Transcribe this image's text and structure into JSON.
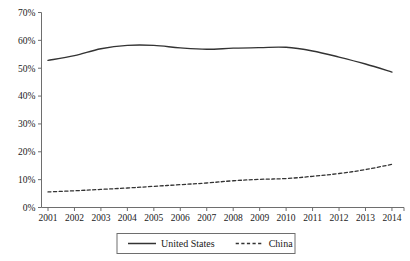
{
  "chart_data": {
    "type": "line",
    "title": "",
    "subtitle": "",
    "xlabel": "",
    "ylabel": "",
    "categories": [
      "2001",
      "2002",
      "2003",
      "2004",
      "2005",
      "2006",
      "2007",
      "2008",
      "2009",
      "2010",
      "2011",
      "2012",
      "2013",
      "2014"
    ],
    "x": [
      2001,
      2002,
      2003,
      2004,
      2005,
      2006,
      2007,
      2008,
      2009,
      2010,
      2011,
      2012,
      2013,
      2014
    ],
    "series": [
      {
        "name": "United States",
        "style": "solid",
        "color": "#333333",
        "values": [
          52.8,
          54.5,
          57.0,
          58.2,
          58.2,
          57.3,
          56.8,
          57.2,
          57.4,
          57.5,
          56.2,
          54.0,
          51.5,
          48.6
        ]
      },
      {
        "name": "China",
        "style": "dashed",
        "color": "#333333",
        "values": [
          5.6,
          6.0,
          6.5,
          7.0,
          7.6,
          8.2,
          8.8,
          9.6,
          10.1,
          10.4,
          11.2,
          12.2,
          13.6,
          15.5
        ]
      }
    ],
    "ylim": [
      0,
      70
    ],
    "yticks": [
      0,
      10,
      20,
      30,
      40,
      50,
      60,
      70
    ],
    "ytick_labels": [
      "0%",
      "10%",
      "20%",
      "30%",
      "40%",
      "50%",
      "60%",
      "70%"
    ],
    "xtick_labels": [
      "2001",
      "2002",
      "2003",
      "2004",
      "2005",
      "2006",
      "2007",
      "2008",
      "2009",
      "2010",
      "2011",
      "2012",
      "2013",
      "2014"
    ],
    "grid": false,
    "legend_position": "bottom",
    "legend": [
      {
        "label": "United States",
        "style": "solid"
      },
      {
        "label": "China",
        "style": "dashed"
      }
    ]
  }
}
